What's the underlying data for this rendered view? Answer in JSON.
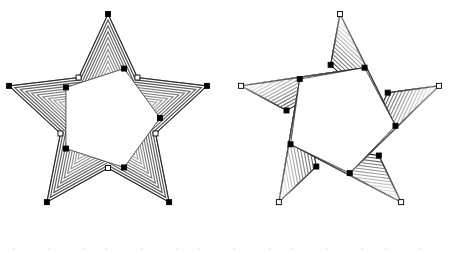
{
  "canvas": {
    "width": 456,
    "height": 254,
    "background": "#ffffff",
    "title": "Star Blend Canvas"
  },
  "style": {
    "stroke_color": "#1a1a1a",
    "stroke_width": 0.7,
    "handle_fill_selected": "#000000",
    "handle_fill_unselected": "#ffffff",
    "handle_stroke": "#000000",
    "handle_size": 5,
    "gradient_dark": "#4a4a4a",
    "gradient_light": "#f0f0f0"
  },
  "shapes": [
    {
      "id": "star-left",
      "name": "concentric-star-blend",
      "label": "Left Star",
      "type": "nested-contour-star",
      "points": 5,
      "center": {
        "x": 108,
        "y": 118
      },
      "outer_radius": 104,
      "inner_radius": 50,
      "rotation_deg": -90,
      "steps": 18,
      "min_scale": 0.02,
      "fill": "none",
      "gradient_from": "#4a4a4a",
      "gradient_to": "#f4f4f4",
      "handles": {
        "outer_tips": "filled",
        "inner_notches": "hollow",
        "core_vertices": "filled"
      },
      "core_polygon": {
        "name": "inner-pentagon",
        "radius": 52,
        "rotation_deg": -72,
        "fill": "#ffffff"
      }
    },
    {
      "id": "star-right",
      "name": "twisted-star-blend",
      "label": "Right Star",
      "type": "rotating-fan-star",
      "points": 5,
      "center": {
        "x": 340,
        "y": 118
      },
      "outer_radius": 104,
      "inner_radius": 54,
      "rotation_deg": -90,
      "twist_deg": 26,
      "steps": 14,
      "fill": "none",
      "gradient_from": "#595959",
      "gradient_to": "#efefef",
      "handles": {
        "outer_tips": "hollow",
        "inner_notches": "filled",
        "core_vertices": "filled"
      },
      "core_polygon": {
        "name": "inner-pentagon",
        "radius": 56,
        "rotation_deg": -64,
        "fill": "#ffffff"
      }
    }
  ],
  "handles": {
    "left_star_outer_label": "outer-tip-handle",
    "left_star_notch_label": "inner-notch-handle",
    "left_star_core_label": "core-vertex-handle",
    "right_star_outer_label": "outer-tip-handle",
    "right_star_notch_label": "inner-notch-handle",
    "right_star_core_label": "core-vertex-handle"
  },
  "artifacts": {
    "description": "faint compression noise band along bottom edge",
    "dot_count": 14
  }
}
